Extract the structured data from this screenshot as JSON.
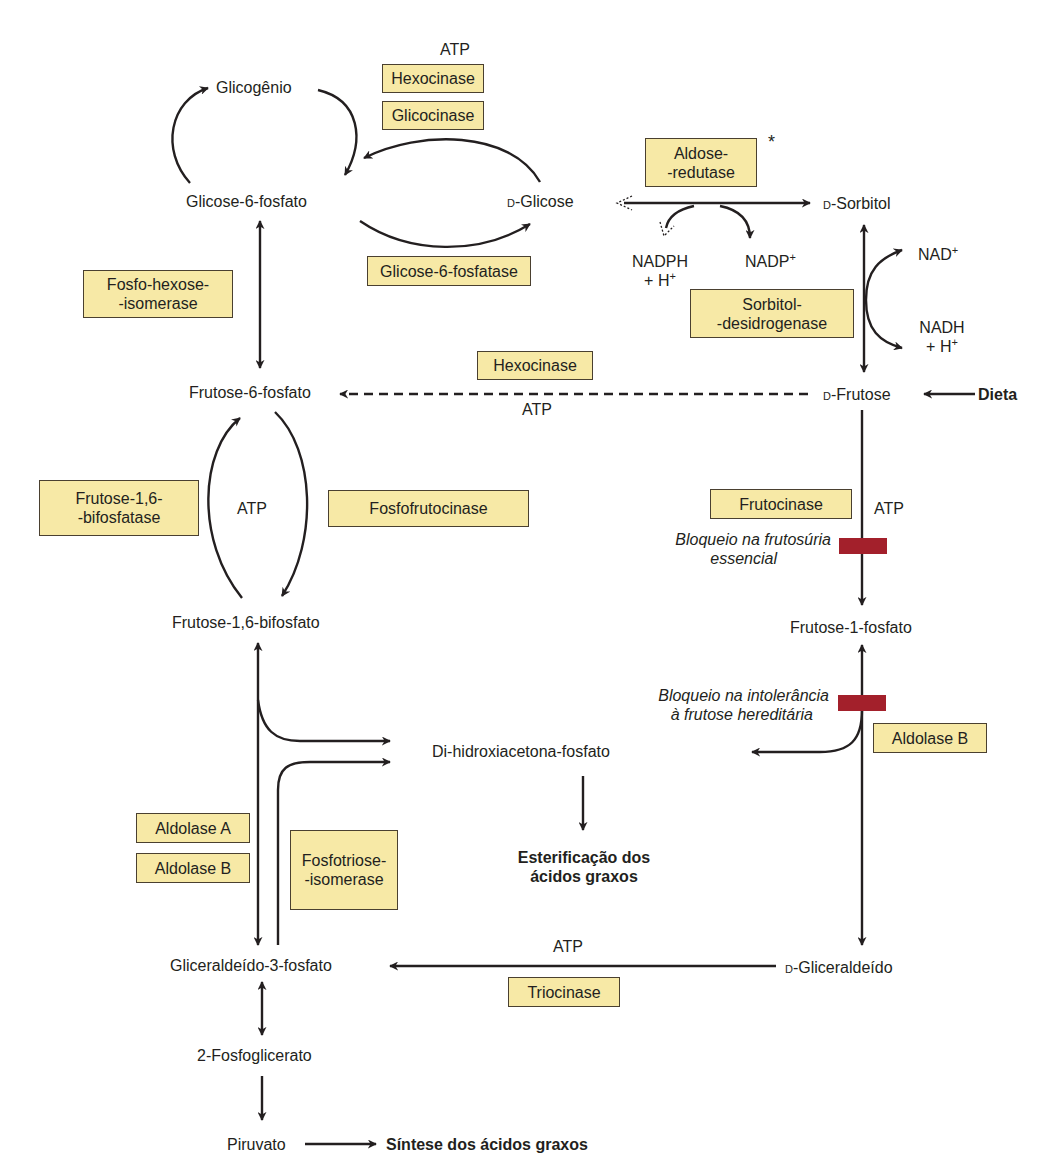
{
  "metabolites": {
    "glicogenio": "Glicogênio",
    "glicose6p": "Glicose-6-fosfato",
    "d_glicose_prefix": "D",
    "d_glicose": "-Glicose",
    "d_sorbitol_prefix": "D",
    "d_sorbitol": "-Sorbitol",
    "frutose6p": "Frutose-6-fosfato",
    "d_frutose_prefix": "D",
    "d_frutose": "-Frutose",
    "dieta": "Dieta",
    "frutose16bp": "Frutose-1,6-bifosfato",
    "frutose1p": "Frutose-1-fosfato",
    "dhap": "Di-hidroxiacetona-fosfato",
    "esterificacao_l1": "Esterificação dos",
    "esterificacao_l2": "ácidos graxos",
    "gliceraldeido3p": "Gliceraldeído-3-fosfato",
    "d_gliceraldeido_prefix": "D",
    "d_gliceraldeido": "-Gliceraldeído",
    "fosfoglicerato": "2-Fosfoglicerato",
    "piruvato": "Piruvato",
    "sintese": "Síntese dos ácidos graxos"
  },
  "cofactors": {
    "atp_top": "ATP",
    "atp_hexocinase": "ATP",
    "atp_pfk": "ATP",
    "atp_frutocinase": "ATP",
    "atp_triocinase": "ATP",
    "nadph_l1": "NADPH",
    "nadph_l2": "+ H",
    "nadp": "NADP",
    "nad": "NAD",
    "nadh_l1": "NADH",
    "nadh_l2": "+ H",
    "plus": "+",
    "asterisk": "*"
  },
  "enzymes": {
    "hexocinase_top": "Hexocinase",
    "glicocinase": "Glicocinase",
    "aldose_redutase": "Aldose-\n-redutase",
    "glicose6fosfatase": "Glicose-6-fosfatase",
    "fosfohexose_isomerase": "Fosfo-hexose-\n-isomerase",
    "sorbitol_desidrogenase": "Sorbitol-\n-desidrogenase",
    "hexocinase_mid": "Hexocinase",
    "frutose16bifosfatase": "Frutose-1,6-\n-bifosfatase",
    "fosfofrutocinase": "Fosfofrutocinase",
    "frutocinase": "Frutocinase",
    "aldolase_b_right": "Aldolase B",
    "aldolase_a": "Aldolase A",
    "aldolase_b_left": "Aldolase B",
    "fosfotriose_isomerase": "Fosfotriose-\n-isomerase",
    "triocinase": "Triocinase"
  },
  "blocks": {
    "frutosuria_l1": "Bloqueio na frutosúria",
    "frutosuria_l2": "essencial",
    "intolerancia_l1": "Bloqueio na intolerância",
    "intolerancia_l2": "à frutose hereditária"
  },
  "colors": {
    "enzyme_box_fill": "#f7e9a6",
    "block_bar": "#a3202b",
    "line": "#231f20"
  }
}
